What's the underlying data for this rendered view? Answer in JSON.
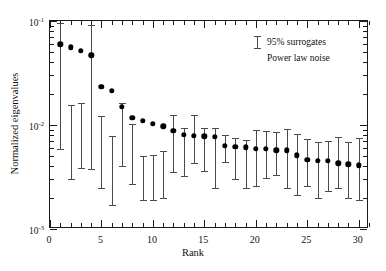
{
  "chart_data": {
    "type": "scatter",
    "title": "",
    "xlabel": "Rank",
    "ylabel": "Normalized eigenvalues",
    "yscale": "log",
    "xlim": [
      0,
      31
    ],
    "ylim": [
      0.001,
      0.1
    ],
    "grid": false,
    "x_ticks": [
      0,
      5,
      10,
      15,
      20,
      25,
      30
    ],
    "x_tick_labels": [
      "0",
      "5",
      "10",
      "15",
      "20",
      "25",
      "30"
    ],
    "y_ticks": [
      0.1,
      0.01,
      0.001
    ],
    "y_tick_labels": [
      "10-1",
      "10-2",
      "10-3"
    ],
    "y_tick_mantissas": [
      "10",
      "10",
      "10"
    ],
    "y_tick_exponents": [
      "-1",
      "-2",
      "-3"
    ],
    "legend": {
      "position": "top-right",
      "entries": [
        {
          "marker": "errorbar",
          "label": "95% surrogates"
        },
        {
          "marker": "none",
          "label": "Power law noise"
        }
      ]
    },
    "series": [
      {
        "name": "Normalized eigenvalues",
        "marker": "filled-circle",
        "color": "#000000",
        "x": [
          1,
          2,
          3,
          4,
          5,
          6,
          7,
          8,
          9,
          10,
          11,
          12,
          13,
          14,
          15,
          16,
          17,
          18,
          19,
          20,
          21,
          22,
          23,
          24,
          25,
          26,
          27,
          28,
          29,
          30
        ],
        "values": [
          0.0597,
          0.0559,
          0.052,
          0.0468,
          0.0232,
          0.0213,
          0.015,
          0.0118,
          0.011,
          0.0102,
          0.0097,
          0.0088,
          0.0081,
          0.0079,
          0.0078,
          0.0077,
          0.0063,
          0.0062,
          0.0061,
          0.0059,
          0.0059,
          0.0057,
          0.0057,
          0.0051,
          0.0046,
          0.0045,
          0.0045,
          0.0043,
          0.0042,
          0.0041
        ]
      },
      {
        "name": "95% surrogates",
        "marker": "errorbar",
        "color": "#4a4a4a",
        "x": [
          1,
          2,
          3,
          4,
          5,
          6,
          7,
          8,
          9,
          10,
          11,
          12,
          13,
          14,
          15,
          16,
          17,
          18,
          19,
          20,
          21,
          22,
          23,
          24,
          25,
          26,
          27,
          28,
          29,
          30
        ],
        "lower": [
          0.0059,
          0.003,
          0.0039,
          0.0038,
          0.0025,
          0.0017,
          0.004,
          0.0027,
          0.0019,
          0.0019,
          0.002,
          0.0035,
          0.0032,
          0.0043,
          0.0036,
          0.0025,
          0.0044,
          0.003,
          0.0025,
          0.0026,
          0.0031,
          0.0033,
          0.0025,
          0.0021,
          0.0026,
          0.002,
          0.0023,
          0.0025,
          0.002,
          0.0019
        ],
        "upper": [
          0.0955,
          0.0154,
          0.0162,
          0.0923,
          0.0121,
          0.0079,
          0.0163,
          0.0102,
          0.005,
          0.0052,
          0.0056,
          0.0125,
          0.0093,
          0.0125,
          0.0093,
          0.0093,
          0.008,
          0.0075,
          0.0072,
          0.009,
          0.0088,
          0.0086,
          0.0091,
          0.0082,
          0.0073,
          0.0068,
          0.007,
          0.0077,
          0.0068,
          0.0075
        ]
      }
    ]
  },
  "figure": {
    "xaxis_title": "Rank",
    "yaxis_title": "Normalized eigenvalues"
  }
}
